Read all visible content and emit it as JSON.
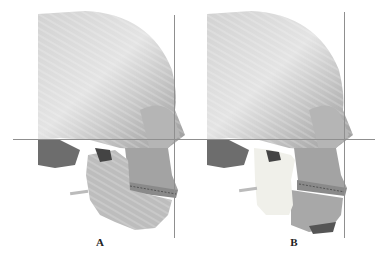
{
  "figure": {
    "panels": [
      {
        "label": "A",
        "description": "3D skull lateral view, pre-operative, with horizontal and vertical reference lines"
      },
      {
        "label": "B",
        "description": "3D skull lateral view, post-operative simulation with repositioned mandible (highlighted ramus)"
      }
    ],
    "colors": {
      "bone": "#c8c8c8",
      "bone_shadow": "#7a7a7a",
      "bone_highlight": "#ededed",
      "mandible_highlight": "#f0f0ea",
      "reference_line": "#8f8f8f",
      "background": "#ffffff"
    }
  }
}
